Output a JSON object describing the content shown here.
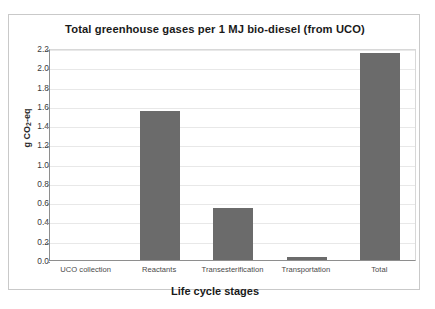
{
  "chart_data": {
    "type": "bar",
    "title": "Total greenhouse gases per 1 MJ bio-diesel (from UCO)",
    "xlabel": "Life cycle stages",
    "ylabel": "g CO2-eq",
    "ylabel_prefix": "g CO",
    "ylabel_sub": "2",
    "ylabel_suffix": "-eq",
    "categories": [
      "UCO collection",
      "Reactants",
      "Transesterification",
      "Transportation",
      "Total"
    ],
    "values": [
      0.0,
      1.55,
      0.54,
      0.03,
      2.15
    ],
    "ylim": [
      0.0,
      2.2
    ],
    "ytick_step": 0.2,
    "yticks": [
      "0.0",
      "0.2",
      "0.4",
      "0.6",
      "0.8",
      "1.0",
      "1.2",
      "1.4",
      "1.6",
      "1.8",
      "2.0",
      "2.2"
    ],
    "ytick_values": [
      0.0,
      0.2,
      0.4,
      0.6,
      0.8,
      1.0,
      1.2,
      1.4,
      1.6,
      1.8,
      2.0,
      2.2
    ],
    "grid": true,
    "legend": false,
    "bar_color": "#6b6b6b",
    "gridline_color": "#e8e8e8",
    "axis_color": "#8e8e8e"
  }
}
